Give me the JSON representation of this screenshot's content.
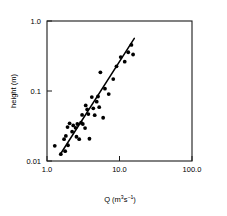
{
  "chart_data": {
    "type": "scatter",
    "title": "",
    "xlabel": "Q (m3s-1)",
    "ylabel": "height (m)",
    "xlabel_parts": {
      "base": "Q (m",
      "sup1": "3",
      "mid": "s",
      "sup2": "−1",
      "tail": ")"
    },
    "xscale": "log",
    "yscale": "log",
    "xlim": [
      1.0,
      100.0
    ],
    "ylim": [
      0.01,
      1.0
    ],
    "xticks": [
      1.0,
      10.0,
      100.0
    ],
    "xtick_labels": [
      "1.0",
      "10.0",
      "100.0"
    ],
    "yticks": [
      0.01,
      0.1,
      1.0
    ],
    "ytick_labels": [
      "0.01",
      "0.1",
      "1.0"
    ],
    "grid": false,
    "legend": false,
    "marker": "filled-circle",
    "marker_color": "#000000",
    "points": [
      {
        "x": 1.28,
        "y": 0.0165
      },
      {
        "x": 1.55,
        "y": 0.0125
      },
      {
        "x": 1.78,
        "y": 0.0138
      },
      {
        "x": 1.72,
        "y": 0.0205
      },
      {
        "x": 1.82,
        "y": 0.0228
      },
      {
        "x": 1.95,
        "y": 0.0168
      },
      {
        "x": 1.92,
        "y": 0.0305
      },
      {
        "x": 2.05,
        "y": 0.0345
      },
      {
        "x": 2.22,
        "y": 0.0262
      },
      {
        "x": 2.3,
        "y": 0.0322
      },
      {
        "x": 2.48,
        "y": 0.0298
      },
      {
        "x": 2.55,
        "y": 0.0222
      },
      {
        "x": 2.62,
        "y": 0.0338
      },
      {
        "x": 2.78,
        "y": 0.0205
      },
      {
        "x": 2.95,
        "y": 0.0352
      },
      {
        "x": 3.05,
        "y": 0.0455
      },
      {
        "x": 3.12,
        "y": 0.0338
      },
      {
        "x": 3.35,
        "y": 0.0295
      },
      {
        "x": 3.42,
        "y": 0.0622
      },
      {
        "x": 3.58,
        "y": 0.0545
      },
      {
        "x": 3.72,
        "y": 0.0468
      },
      {
        "x": 3.85,
        "y": 0.0208
      },
      {
        "x": 4.15,
        "y": 0.0818
      },
      {
        "x": 4.35,
        "y": 0.0565
      },
      {
        "x": 4.55,
        "y": 0.0452
      },
      {
        "x": 4.85,
        "y": 0.0705
      },
      {
        "x": 5.05,
        "y": 0.0835
      },
      {
        "x": 5.25,
        "y": 0.0588
      },
      {
        "x": 5.45,
        "y": 0.185
      },
      {
        "x": 5.95,
        "y": 0.0415
      },
      {
        "x": 6.3,
        "y": 0.108
      },
      {
        "x": 7.1,
        "y": 0.0905
      },
      {
        "x": 8.2,
        "y": 0.148
      },
      {
        "x": 9.1,
        "y": 0.225
      },
      {
        "x": 10.4,
        "y": 0.305
      },
      {
        "x": 11.8,
        "y": 0.262
      },
      {
        "x": 13.2,
        "y": 0.358
      },
      {
        "x": 14.6,
        "y": 0.455
      },
      {
        "x": 15.4,
        "y": 0.332
      }
    ],
    "trend_line": {
      "x_start": 1.55,
      "y_start": 0.0128,
      "x_end": 16.0,
      "y_end": 0.565,
      "color": "#000000"
    }
  }
}
